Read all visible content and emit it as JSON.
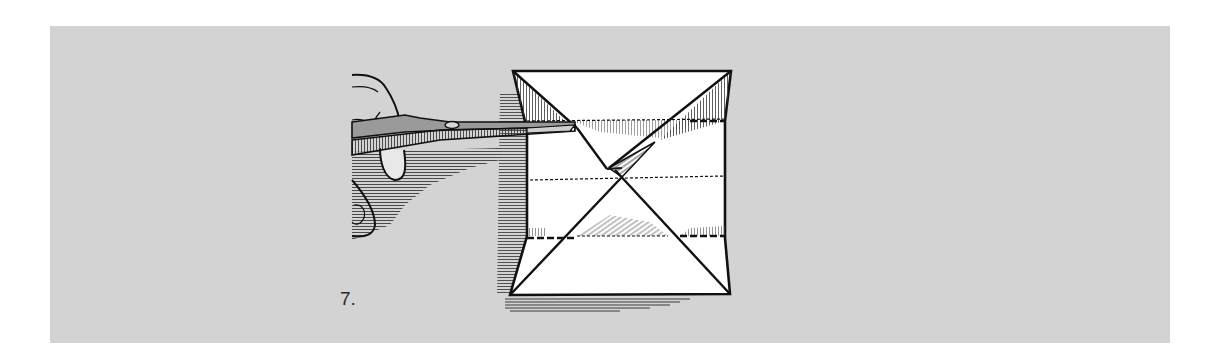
{
  "figure": {
    "step_number": "7.",
    "colors": {
      "panel_background": "#d3d3d3",
      "paper": "#ffffff",
      "ink": "#1a1a1a",
      "hatching": "#3a3a3a"
    }
  }
}
